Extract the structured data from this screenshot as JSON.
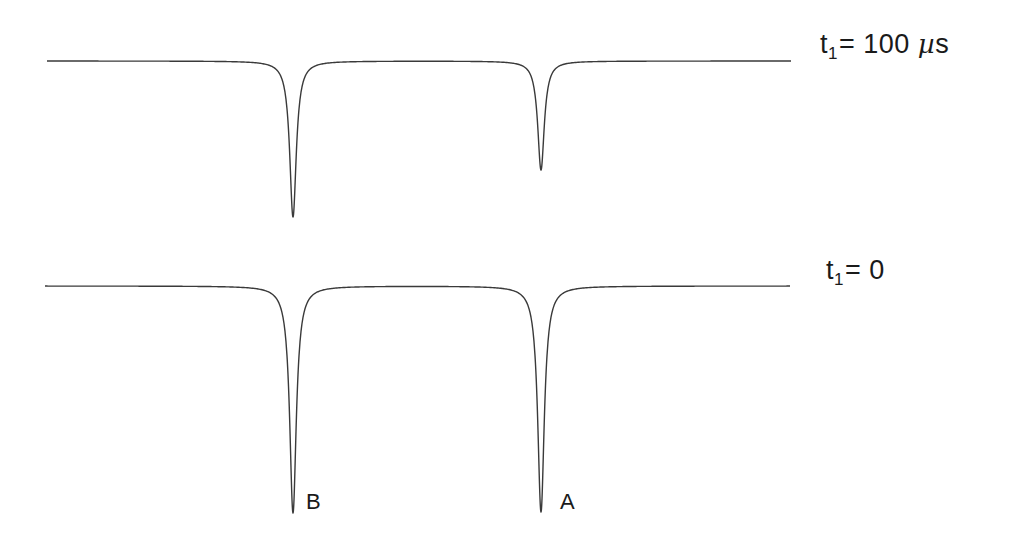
{
  "chart_data": {
    "type": "line",
    "title": "",
    "xlabel": "",
    "ylabel": "",
    "grid": false,
    "legend": "inline labels at right of each trace",
    "series": [
      {
        "name": "t1 = 100 µs",
        "label_main": "t",
        "label_sub": "1",
        "label_eq": "= 100 ",
        "label_unit_mu": "µ",
        "label_unit": "s",
        "baseline_y": 61,
        "x_start": 47,
        "x_end": 791,
        "peaks": [
          {
            "name": "B",
            "x": 293,
            "depth": 156,
            "hwhm": 4
          },
          {
            "name": "A",
            "x": 541,
            "depth": 109,
            "hwhm": 4
          }
        ]
      },
      {
        "name": "t1 = 0",
        "label_main": "t",
        "label_sub": "1",
        "label_eq": "= 0",
        "baseline_y": 286,
        "x_start": 45,
        "x_end": 790,
        "peaks": [
          {
            "name": "B",
            "x": 293,
            "depth": 227,
            "hwhm": 4
          },
          {
            "name": "A",
            "x": 541,
            "depth": 226,
            "hwhm": 4
          }
        ]
      }
    ],
    "relative_intensities": {
      "t1=100us": {
        "B": 0.69,
        "A": 0.48
      },
      "t1=0": {
        "B": 1.0,
        "A": 1.0
      }
    },
    "peak_labels": [
      "B",
      "A"
    ]
  },
  "labels": {
    "top": {
      "main": "t",
      "sub": "1",
      "eq": "= 100 ",
      "mu": "µ",
      "unit": "s"
    },
    "bottom": {
      "main": "t",
      "sub": "1",
      "eq": "= 0"
    },
    "peak_b": "B",
    "peak_a": "A"
  }
}
